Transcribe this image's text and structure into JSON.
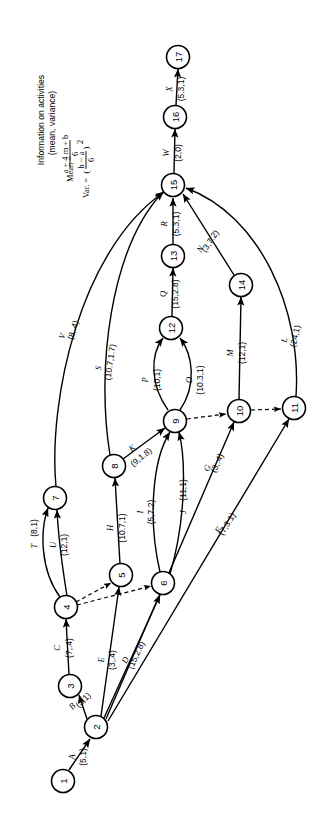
{
  "figure": {
    "type": "pert-cpm-activity-network",
    "orientation_note": "rotated-90-ccw",
    "legend": {
      "line1": "Information on activities",
      "line2": "(mean, variance)",
      "mean_label": "Mean =",
      "mean_numerator": "a + 4 m + b",
      "mean_denominator": "6",
      "var_label": "Var.  =",
      "var_numerator": "b − a",
      "var_denominator": "6",
      "var_exponent": "2"
    },
    "nodes": [
      {
        "id": "1",
        "label": "1",
        "x": 63,
        "y": 781
      },
      {
        "id": "2",
        "label": "2",
        "x": 96,
        "y": 727
      },
      {
        "id": "3",
        "label": "3",
        "x": 70,
        "y": 686
      },
      {
        "id": "4",
        "label": "4",
        "x": 66,
        "y": 607
      },
      {
        "id": "5",
        "label": "5",
        "x": 121,
        "y": 575
      },
      {
        "id": "6",
        "label": "6",
        "x": 163,
        "y": 583
      },
      {
        "id": "7",
        "label": "7",
        "x": 55,
        "y": 498
      },
      {
        "id": "8",
        "label": "8",
        "x": 114,
        "y": 466
      },
      {
        "id": "9",
        "label": "9",
        "x": 175,
        "y": 421
      },
      {
        "id": "10",
        "label": "10",
        "x": 239,
        "y": 411
      },
      {
        "id": "11",
        "label": "11",
        "x": 294,
        "y": 408
      },
      {
        "id": "12",
        "label": "12",
        "x": 171,
        "y": 328
      },
      {
        "id": "13",
        "label": "13",
        "x": 173,
        "y": 256
      },
      {
        "id": "14",
        "label": "14",
        "x": 241,
        "y": 285
      },
      {
        "id": "15",
        "label": "15",
        "x": 173,
        "y": 185
      },
      {
        "id": "16",
        "label": "16",
        "x": 175,
        "y": 117
      },
      {
        "id": "17",
        "label": "17",
        "x": 178,
        "y": 57
      }
    ],
    "node_radius": 11.5,
    "edges": [
      {
        "id": "A",
        "from": "1",
        "to": "2",
        "name": "A",
        "value": "(5,1)",
        "dashed": false
      },
      {
        "id": "B",
        "from": "2",
        "to": "3",
        "name": "B",
        "value": "(3,1)",
        "dashed": false
      },
      {
        "id": "C",
        "from": "3",
        "to": "4",
        "name": "C",
        "value": "(7,.4)",
        "dashed": false
      },
      {
        "id": "D",
        "from": "2",
        "to": "6",
        "name": "D",
        "value": "(15,2.8)",
        "dashed": false
      },
      {
        "id": "E",
        "from": "2",
        "to": "5",
        "name": "E",
        "value": "(3,.4)",
        "dashed": false
      },
      {
        "id": "F",
        "from": "2",
        "to": "11",
        "name": "F",
        "value": "(7,3.1)",
        "dashed": false
      },
      {
        "id": "G",
        "from": "2",
        "to": "10",
        "name": "G",
        "value": "(3,.4)",
        "dashed": false
      },
      {
        "id": "H",
        "from": "5",
        "to": "8",
        "name": "H",
        "value": "(10.7,1)",
        "dashed": false
      },
      {
        "id": "I",
        "from": "6",
        "to": "9",
        "name": "I",
        "value": "(5,7.2)",
        "dashed": false
      },
      {
        "id": "J",
        "from": "6",
        "to": "9",
        "name": "J",
        "value": "(11,1)",
        "dashed": false
      },
      {
        "id": "K",
        "from": "8",
        "to": "9",
        "name": "K",
        "value": "(9,1.8)",
        "dashed": false
      },
      {
        "id": "L",
        "from": "11",
        "to": "15",
        "name": "L",
        "value": "(24,1)",
        "dashed": false
      },
      {
        "id": "M",
        "from": "10",
        "to": "14",
        "name": "M",
        "value": "(12,1)",
        "dashed": false
      },
      {
        "id": "N",
        "from": "14",
        "to": "15",
        "name": "N",
        "value": "(3,7.2)",
        "dashed": false
      },
      {
        "id": "O",
        "from": "9",
        "to": "12",
        "name": "O",
        "value": "(10.3,1)",
        "dashed": false
      },
      {
        "id": "P",
        "from": "9",
        "to": "12",
        "name": "P",
        "value": "(10,1)",
        "dashed": false
      },
      {
        "id": "Q",
        "from": "12",
        "to": "13",
        "name": "Q",
        "value": "(15,2.8)",
        "dashed": false
      },
      {
        "id": "R",
        "from": "13",
        "to": "15",
        "name": "R",
        "value": "(5.3,1)",
        "dashed": false
      },
      {
        "id": "S",
        "from": "8",
        "to": "15",
        "name": "S",
        "value": "(10.7,1.7)",
        "dashed": false
      },
      {
        "id": "T",
        "from": "4",
        "to": "7",
        "name": "T",
        "value": "(8,1)",
        "dashed": false
      },
      {
        "id": "U",
        "from": "4",
        "to": "7",
        "name": "U",
        "value": "(12,1)",
        "dashed": false
      },
      {
        "id": "V",
        "from": "7",
        "to": "15",
        "name": "V",
        "value": "(8,.4)",
        "dashed": false
      },
      {
        "id": "W",
        "from": "15",
        "to": "16",
        "name": "W",
        "value": "(2,0)",
        "dashed": false
      },
      {
        "id": "X",
        "from": "16",
        "to": "17",
        "name": "X",
        "value": "(5.3,1)",
        "dashed": false
      },
      {
        "id": "d1",
        "from": "4",
        "to": "5",
        "name": "",
        "value": "",
        "dashed": true
      },
      {
        "id": "d2",
        "from": "4",
        "to": "6",
        "name": "",
        "value": "",
        "dashed": true
      },
      {
        "id": "d3",
        "from": "9",
        "to": "10",
        "name": "",
        "value": "",
        "dashed": true
      },
      {
        "id": "d4",
        "from": "10",
        "to": "11",
        "name": "",
        "value": "",
        "dashed": true
      }
    ]
  }
}
